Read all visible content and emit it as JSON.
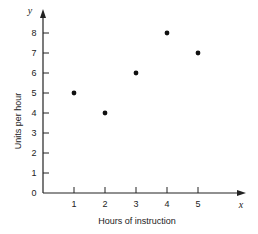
{
  "chart_data": {
    "type": "scatter",
    "title": "",
    "xlabel": "Hours of instruction",
    "ylabel": "Units per hour",
    "x_axis_variable": "x",
    "y_axis_variable": "y",
    "x": [
      1,
      2,
      3,
      4,
      5
    ],
    "y": [
      5,
      4,
      6,
      8,
      7
    ],
    "points": [
      {
        "x": 1,
        "y": 5
      },
      {
        "x": 2,
        "y": 4
      },
      {
        "x": 3,
        "y": 6
      },
      {
        "x": 4,
        "y": 8
      },
      {
        "x": 5,
        "y": 7
      }
    ],
    "x_ticks": [
      "1",
      "2",
      "3",
      "4",
      "5"
    ],
    "y_ticks": [
      "0",
      "1",
      "2",
      "3",
      "4",
      "5",
      "6",
      "7",
      "8"
    ],
    "xlim": [
      0,
      6.5
    ],
    "ylim": [
      0,
      9
    ],
    "grid": false,
    "legend": null,
    "colors": {
      "axis": "#222222",
      "point": "#111111"
    }
  }
}
